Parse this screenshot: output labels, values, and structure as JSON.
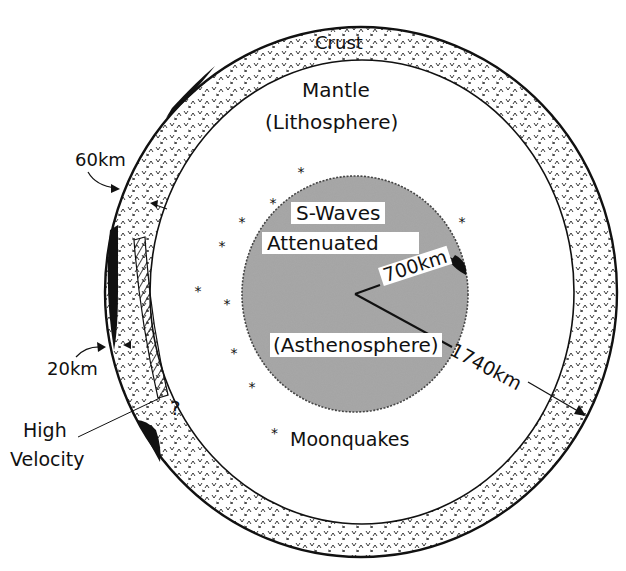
{
  "figure": {
    "colors": {
      "background": "#ffffff",
      "ink": "#111111",
      "core_fill": "#9a9a9a",
      "crust_fill": "#ffffff"
    }
  },
  "layers": {
    "crust": {
      "label": "Crust"
    },
    "mantle": {
      "label": "Mantle",
      "sublabel": "(Lithosphere)"
    },
    "core": {
      "label_line1": "S-Waves",
      "label_line2": "Attenuated",
      "sublabel": "(Asthenosphere)"
    }
  },
  "dimensions": {
    "crust_thickness_upper": "60km",
    "crust_thickness_lower": "20km",
    "core_radius": "700km",
    "moon_radius": "1740km"
  },
  "annotations": {
    "high_velocity_line1": "High",
    "high_velocity_line2": "Velocity",
    "question_mark": "?"
  },
  "legend": {
    "symbol": "*",
    "label": "Moonquakes"
  },
  "moonquakes": [
    {
      "x": 301,
      "y": 171
    },
    {
      "x": 273,
      "y": 202
    },
    {
      "x": 242,
      "y": 221
    },
    {
      "x": 222,
      "y": 245
    },
    {
      "x": 198,
      "y": 290
    },
    {
      "x": 227,
      "y": 303
    },
    {
      "x": 234,
      "y": 352
    },
    {
      "x": 252,
      "y": 386
    },
    {
      "x": 462,
      "y": 221
    }
  ]
}
